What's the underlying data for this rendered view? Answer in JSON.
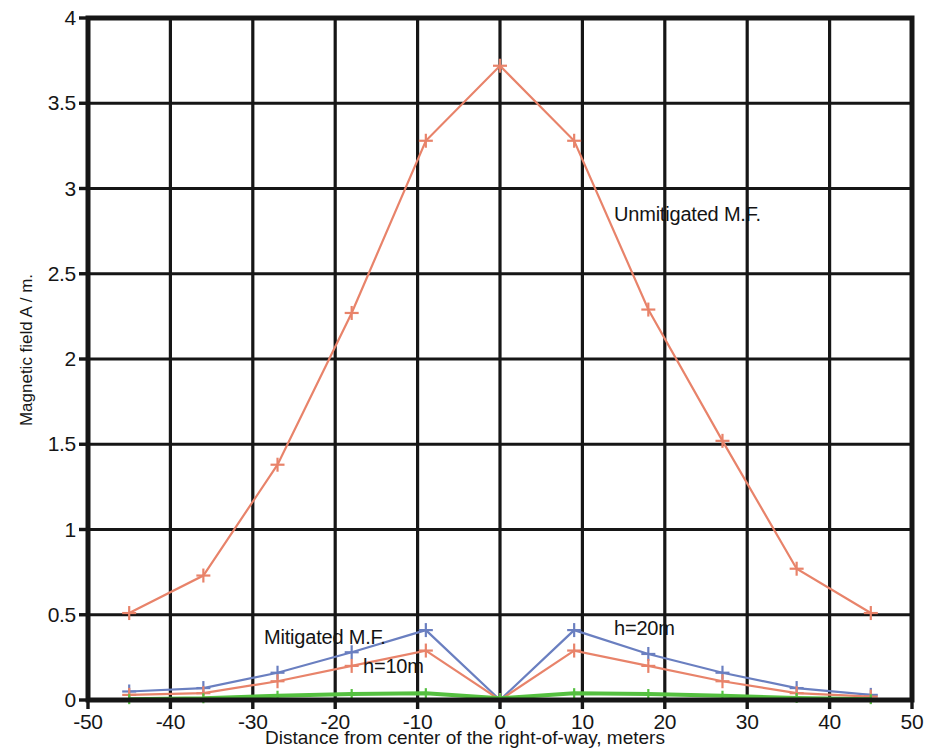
{
  "chart_data": {
    "type": "line",
    "title": "",
    "subtitle": "",
    "xlabel": "Distance from center of the right-of-way, meters",
    "ylabel": "Magnetic field A / m.",
    "xlim": [
      -50,
      50
    ],
    "ylim": [
      0,
      4
    ],
    "xticks": [
      -50,
      -40,
      -30,
      -20,
      -10,
      0,
      10,
      20,
      30,
      40,
      50
    ],
    "xtick_labels": [
      "-50",
      "-40",
      "-30",
      "-20",
      "-10",
      "0",
      "10",
      "20",
      "30",
      "40",
      "50"
    ],
    "yticks": [
      0,
      0.5,
      1,
      1.5,
      2,
      2.5,
      3,
      3.5,
      4
    ],
    "ytick_labels": [
      "0",
      "0.5",
      "1",
      "1.5",
      "2",
      "2.5",
      "3",
      "3.5",
      "4"
    ],
    "grid": true,
    "legend": "none",
    "marker": "plus",
    "series": [
      {
        "name": "Unmitigated M.F.",
        "color": "#e8836a",
        "x": [
          -45,
          -36,
          -27,
          -18,
          -9,
          0,
          9,
          18,
          27,
          36,
          45
        ],
        "y": [
          0.51,
          0.73,
          1.38,
          2.27,
          3.28,
          3.72,
          3.28,
          2.29,
          1.52,
          0.77,
          0.51
        ]
      },
      {
        "name": "Mitigated M.F. h=20m",
        "color": "#6a7fc0",
        "x": [
          -45,
          -36,
          -27,
          -18,
          -9,
          0,
          9,
          18,
          27,
          36,
          45
        ],
        "y": [
          0.05,
          0.07,
          0.16,
          0.28,
          0.41,
          0.0,
          0.41,
          0.27,
          0.16,
          0.07,
          0.03
        ]
      },
      {
        "name": "Mitigated M.F. h=10m",
        "color": "#e8836a",
        "x": [
          -45,
          -36,
          -27,
          -18,
          -9,
          0,
          9,
          18,
          27,
          36,
          45
        ],
        "y": [
          0.03,
          0.04,
          0.11,
          0.2,
          0.29,
          0.0,
          0.29,
          0.2,
          0.11,
          0.04,
          0.02
        ]
      },
      {
        "name": "Mitigated M.F. lowest",
        "color": "#55c040",
        "x": [
          -45,
          -36,
          -27,
          -18,
          -9,
          0,
          9,
          18,
          27,
          36,
          45
        ],
        "y": [
          0.005,
          0.01,
          0.025,
          0.035,
          0.04,
          0.01,
          0.04,
          0.035,
          0.025,
          0.012,
          0.005
        ]
      }
    ],
    "annotations": [
      {
        "id": "unmitigated",
        "text": "Unmitigated M.F."
      },
      {
        "id": "mitigated",
        "text": "Mitigated M.F."
      },
      {
        "id": "h10",
        "text": "h=10m"
      },
      {
        "id": "h20",
        "text": "h=20m"
      }
    ]
  },
  "style": {
    "axis_color": "#161616",
    "grid_color": "#161616",
    "background": "#ffffff"
  }
}
